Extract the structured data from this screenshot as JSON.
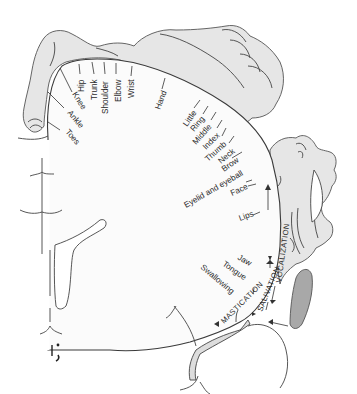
{
  "figure": {
    "body_part_labels": [
      {
        "id": "toes",
        "text": "Toes"
      },
      {
        "id": "ankle",
        "text": "Ankle"
      },
      {
        "id": "knee",
        "text": "Knee"
      },
      {
        "id": "hip",
        "text": "Hip"
      },
      {
        "id": "trunk",
        "text": "Trunk"
      },
      {
        "id": "shoulder",
        "text": "Shoulder"
      },
      {
        "id": "elbow",
        "text": "Elbow"
      },
      {
        "id": "wrist",
        "text": "Wrist"
      },
      {
        "id": "hand",
        "text": "Hand"
      },
      {
        "id": "little",
        "text": "Little"
      },
      {
        "id": "ring",
        "text": "Ring"
      },
      {
        "id": "middle",
        "text": "Middle"
      },
      {
        "id": "index",
        "text": "Index"
      },
      {
        "id": "thumb",
        "text": "Thumb"
      },
      {
        "id": "neck",
        "text": "Neck"
      },
      {
        "id": "brow",
        "text": "Brow"
      },
      {
        "id": "eyelid",
        "text": "Eyelid and eyeball"
      },
      {
        "id": "face",
        "text": "Face"
      },
      {
        "id": "lips",
        "text": "Lips"
      },
      {
        "id": "jaw",
        "text": "Jaw"
      },
      {
        "id": "tongue",
        "text": "Tongue"
      },
      {
        "id": "swallowing",
        "text": "Swallowing"
      }
    ],
    "function_labels": {
      "vocalization": "VOCALIZATION",
      "salivation": "SALIVATION",
      "mastication": "MASTICATION"
    },
    "colors": {
      "body": "#e6e6e6",
      "outline": "#3a3a3a",
      "insula": "#a8a8a8"
    }
  }
}
